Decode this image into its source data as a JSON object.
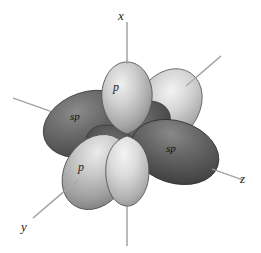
{
  "figure": {
    "background_color": "#ffffff"
  },
  "axes": {
    "color": "#a8a8a8",
    "labels": [
      {
        "name": "x-axis-label",
        "text": "x"
      },
      {
        "name": "y-axis-label",
        "text": "y"
      },
      {
        "name": "z-axis-label",
        "text": "z"
      }
    ]
  },
  "orbitals": {
    "labels": [
      {
        "name": "p-orbital-top-label",
        "text": "p"
      },
      {
        "name": "p-orbital-front-label",
        "text": "p"
      },
      {
        "name": "sp-orbital-left-label",
        "text": "sp"
      },
      {
        "name": "sp-orbital-right-label",
        "text": "sp"
      }
    ]
  },
  "colors": {
    "dark_lobe": "#4f4f4f",
    "dark_lobe_highlight": "#8d8d8d",
    "light_lobe": "#b8b8b8",
    "light_lobe_highlight": "#ededed",
    "outline": "#3a3a3a",
    "axis_line": "#a8a8a8",
    "label_text": "#1a1a1a"
  }
}
